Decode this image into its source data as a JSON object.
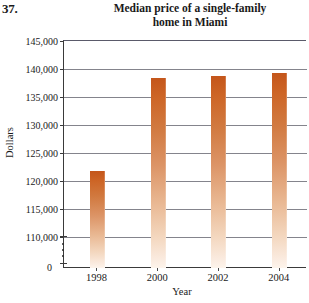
{
  "problem_number": "37.",
  "y_axis_title": "Dollars",
  "x_axis_title": "Year",
  "zero_label": "0",
  "title_line1": "Median price of a single-family",
  "title_line2": "home in Miami",
  "colors": {
    "bar_top": "#c4561b",
    "bar_bottom": "#fdf4ec",
    "gridline": "#6e6e78",
    "axis": "#3a3a3a",
    "text": "#1a1a1a"
  },
  "chart_data": {
    "type": "bar",
    "title": "Median price of a single-family home in Miami",
    "xlabel": "Year",
    "ylabel": "Dollars",
    "categories": [
      "1998",
      "2000",
      "2002",
      "2004"
    ],
    "values": [
      121800,
      138400,
      138800,
      139300
    ],
    "ylim": [
      110000,
      145000
    ],
    "y_axis_broken": true,
    "y_break_between": [
      0,
      110000
    ],
    "ytick_labels": [
      "145,000",
      "140,000",
      "135,000",
      "130,000",
      "125,000",
      "120,000",
      "115,000",
      "110,000",
      "0"
    ],
    "ytick_values": [
      145000,
      140000,
      135000,
      130000,
      125000,
      120000,
      115000,
      110000,
      0
    ],
    "ystep": 5000,
    "grid": true,
    "legend": "none",
    "series": [
      {
        "name": "Median price",
        "values": [
          121800,
          138400,
          138800,
          139300
        ]
      }
    ]
  }
}
